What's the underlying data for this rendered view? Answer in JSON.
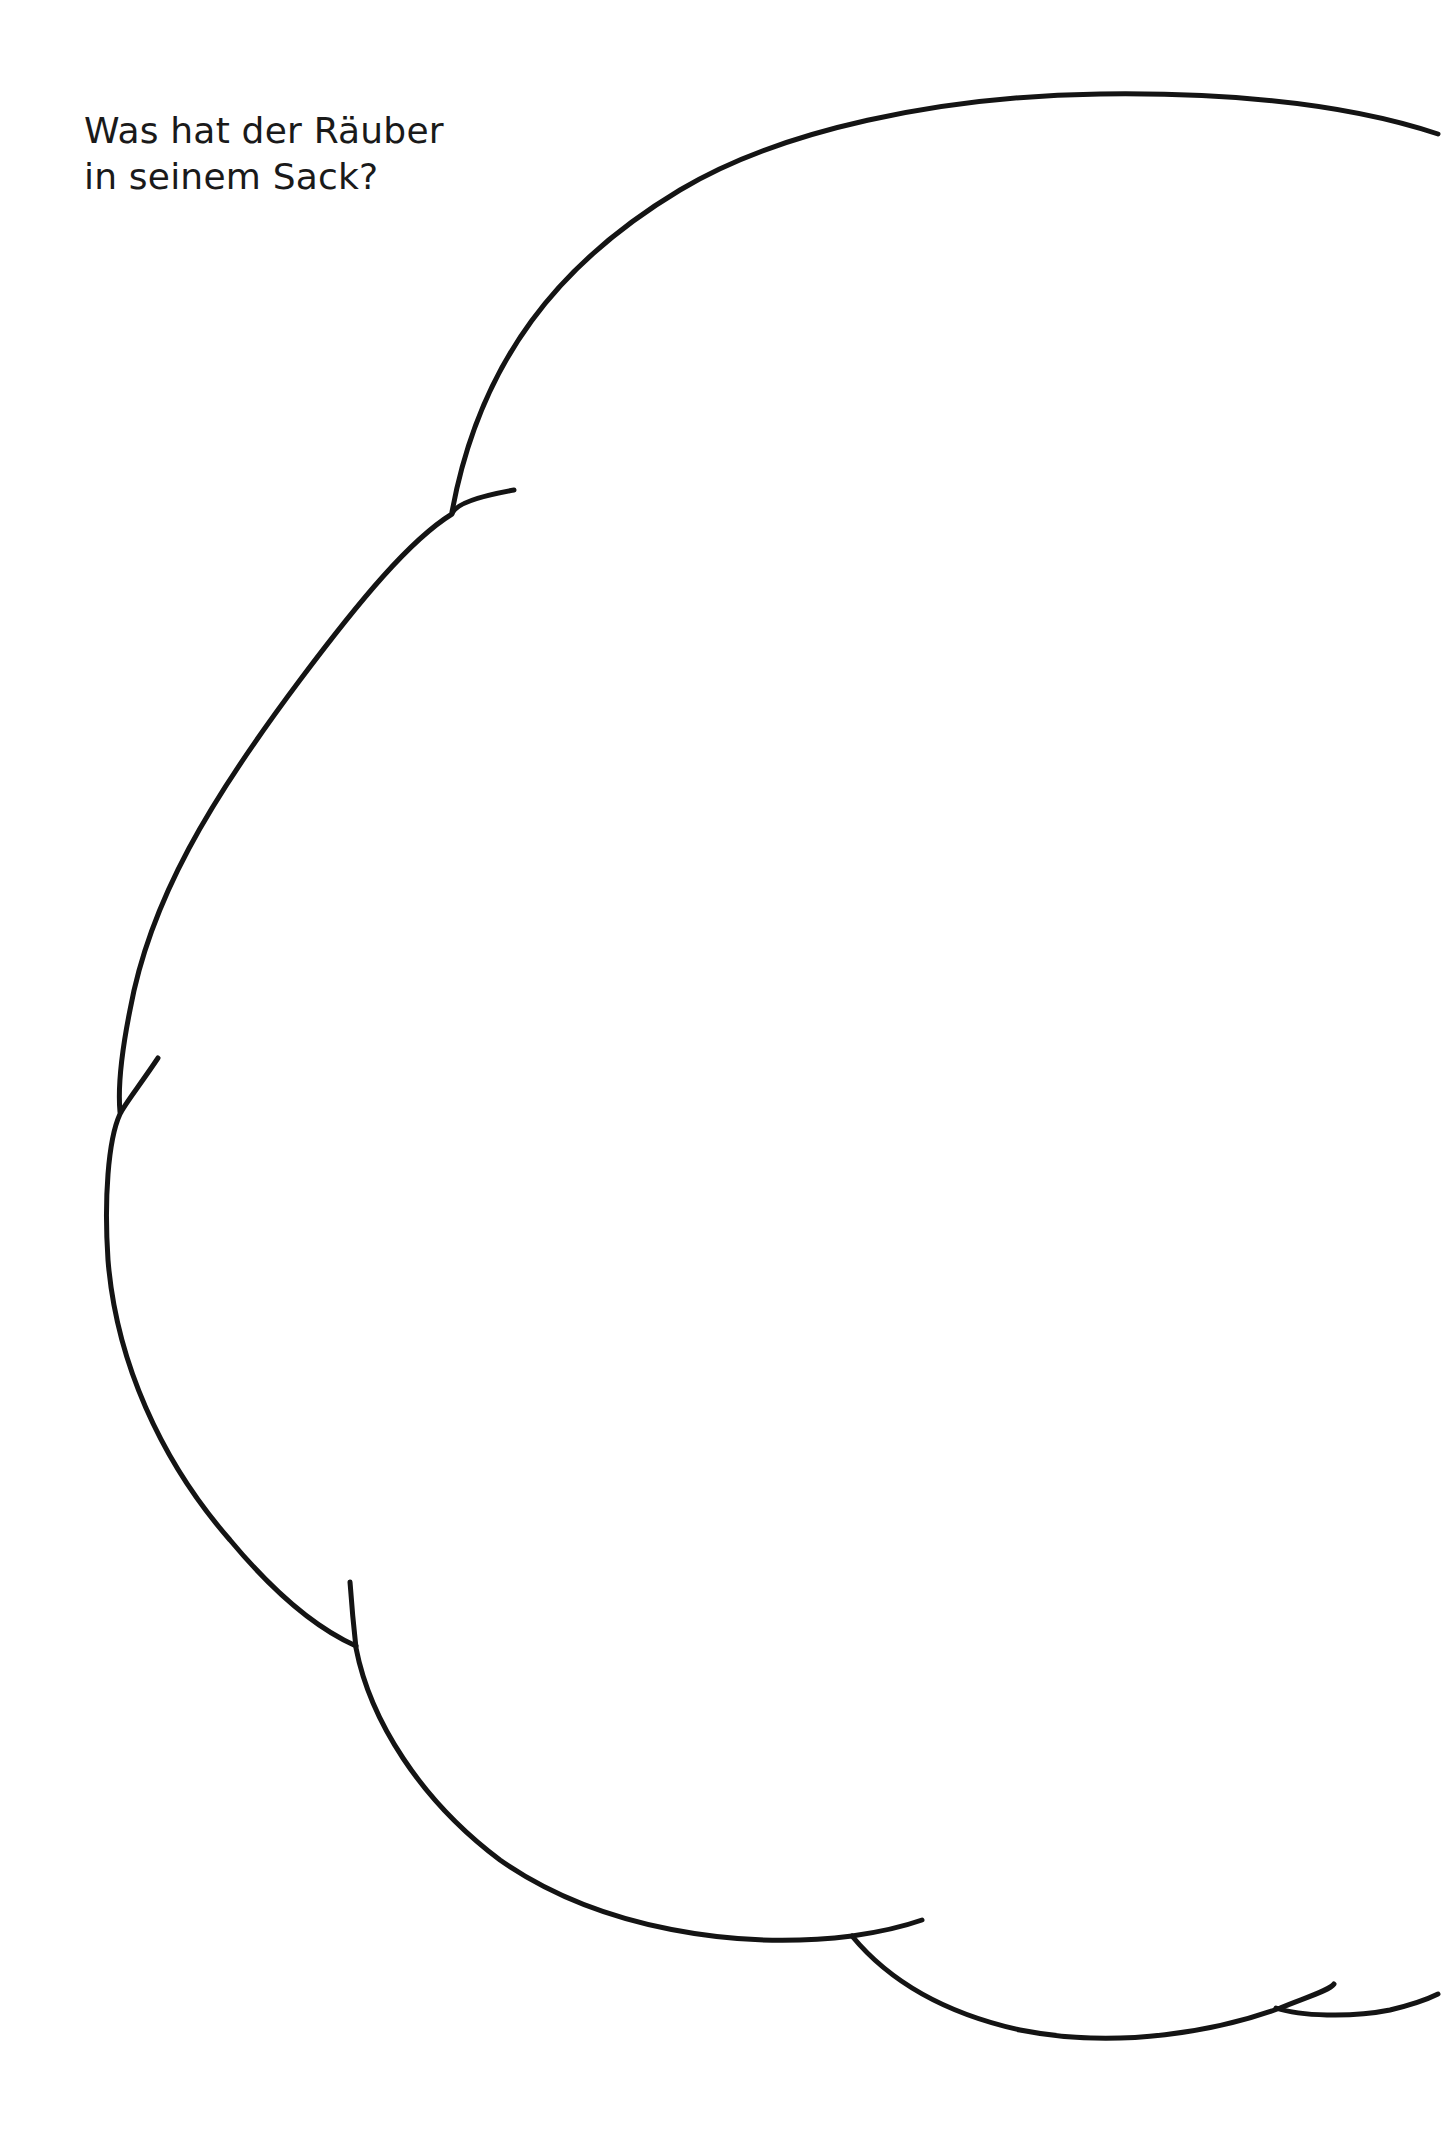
{
  "worksheet": {
    "heading_lines": [
      "Was hat der Räuber",
      "in seinem Sack?"
    ],
    "drawing_area": {
      "shape": "sack-outline",
      "stroke_color": "#141414",
      "background": "#ffffff"
    }
  }
}
